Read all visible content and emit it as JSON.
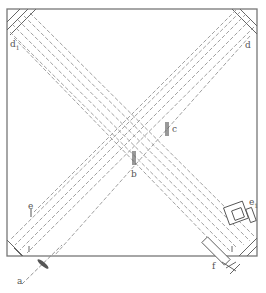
{
  "diagram": {
    "type": "optical-schematic",
    "frame_color": "#777777",
    "line_color": "#888888",
    "labels": {
      "a": "a",
      "b": "b",
      "c": "c",
      "d": "d",
      "d1": "d",
      "d1_sub": "1",
      "e": "e",
      "e1": "e",
      "e1_sub": "1",
      "f": "f"
    },
    "components": [
      {
        "id": "a",
        "name": "light source / lens"
      },
      {
        "id": "b",
        "name": "marker b"
      },
      {
        "id": "c",
        "name": "marker c"
      },
      {
        "id": "d",
        "name": "corner mirror (top-right)"
      },
      {
        "id": "d1",
        "name": "corner mirror (top-left)"
      },
      {
        "id": "e",
        "name": "marker e"
      },
      {
        "id": "e1",
        "name": "detector assembly"
      },
      {
        "id": "f",
        "name": "tube / telescope"
      }
    ]
  }
}
